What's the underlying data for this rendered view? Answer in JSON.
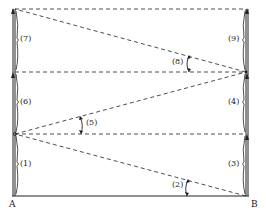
{
  "diagram": {
    "points": {
      "A": {
        "label": "A",
        "x": 11,
        "y": 201
      },
      "B": {
        "label": "B",
        "x": 251,
        "y": 201
      }
    },
    "segment_labels": [
      {
        "id": "1",
        "label": "(1)",
        "x": 20,
        "y": 162
      },
      {
        "id": "3",
        "label": "(3)",
        "x": 240,
        "y": 162
      },
      {
        "id": "4",
        "label": "(4)",
        "x": 240,
        "y": 102
      },
      {
        "id": "6",
        "label": "(6)",
        "x": 20,
        "y": 100
      },
      {
        "id": "7",
        "label": "(7)",
        "x": 20,
        "y": 38
      },
      {
        "id": "9",
        "label": "(9)",
        "x": 240,
        "y": 38
      }
    ],
    "angle_labels": [
      {
        "id": "2",
        "label": "(2)",
        "x": 171,
        "y": 183
      },
      {
        "id": "5",
        "label": "(5)",
        "x": 87,
        "y": 120
      },
      {
        "id": "8",
        "label": "(8)",
        "x": 172,
        "y": 59
      }
    ],
    "colors": {
      "line": "#222222",
      "background": "#ffffff"
    }
  }
}
